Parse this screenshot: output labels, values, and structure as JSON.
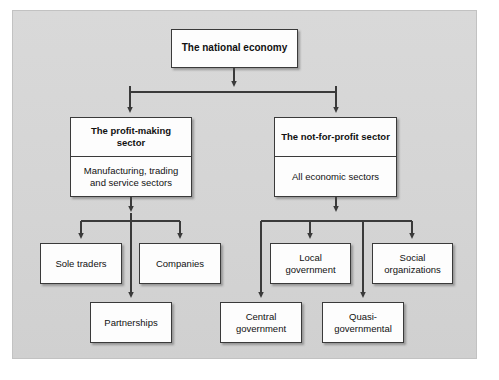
{
  "figure": {
    "type": "hierarchy-flowchart",
    "orientation": "top-down",
    "background_color": "#d6d6d6",
    "node_fill": "#fdfdfd",
    "node_border": "#3a3a3a",
    "connector_color": "#3a3a3a"
  },
  "nodes": {
    "national_economy": {
      "title": "The national economy",
      "level": 0
    },
    "profit_sector": {
      "title": "The profit-making sector",
      "subtitle": "Manufacturing, trading and service sectors",
      "level": 1
    },
    "notforprofit_sector": {
      "title": "The not-for-profit sector",
      "subtitle": "All economic sectors",
      "level": 1
    },
    "sole_traders": {
      "title": "Sole traders",
      "level": 2
    },
    "companies": {
      "title": "Companies",
      "level": 2
    },
    "partnerships": {
      "title": "Partnerships",
      "level": 3
    },
    "local_government": {
      "title": "Local government",
      "level": 2
    },
    "social_organizations": {
      "title": "Social organizations",
      "level": 2
    },
    "central_government": {
      "title": "Central government",
      "level": 3
    },
    "quasi_governmental": {
      "title": "Quasi-governmental",
      "level": 3
    }
  },
  "edges": [
    {
      "from": "national_economy",
      "to": "profit_sector"
    },
    {
      "from": "national_economy",
      "to": "notforprofit_sector"
    },
    {
      "from": "profit_sector",
      "to": "sole_traders"
    },
    {
      "from": "profit_sector",
      "to": "companies"
    },
    {
      "from": "profit_sector",
      "to": "partnerships"
    },
    {
      "from": "notforprofit_sector",
      "to": "central_government"
    },
    {
      "from": "notforprofit_sector",
      "to": "local_government"
    },
    {
      "from": "notforprofit_sector",
      "to": "quasi_governmental"
    },
    {
      "from": "notforprofit_sector",
      "to": "social_organizations"
    }
  ]
}
